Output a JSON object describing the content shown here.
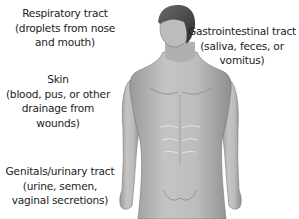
{
  "diagram": {
    "labels": [
      {
        "id": "respiratory",
        "lines": [
          "Respiratory tract",
          "(droplets from nose",
          "and mouth)"
        ]
      },
      {
        "id": "gastrointestinal",
        "lines": [
          "Gastrointestinal tract",
          "(saliva, feces, or",
          "vomitus)"
        ]
      },
      {
        "id": "skin",
        "lines": [
          "Skin",
          "(blood, pus, or other",
          "drainage from",
          "wounds)"
        ]
      },
      {
        "id": "genitals",
        "lines": [
          "Genitals/urinary tract",
          "(urine, semen,",
          "vaginal secretions)"
        ]
      }
    ],
    "colors": {
      "skin": "#b9b9b9",
      "skin_shadow": "#8f8f8f",
      "hair": "#4a4a4a",
      "outline": "#6a6a6a",
      "text": "#222222"
    }
  }
}
